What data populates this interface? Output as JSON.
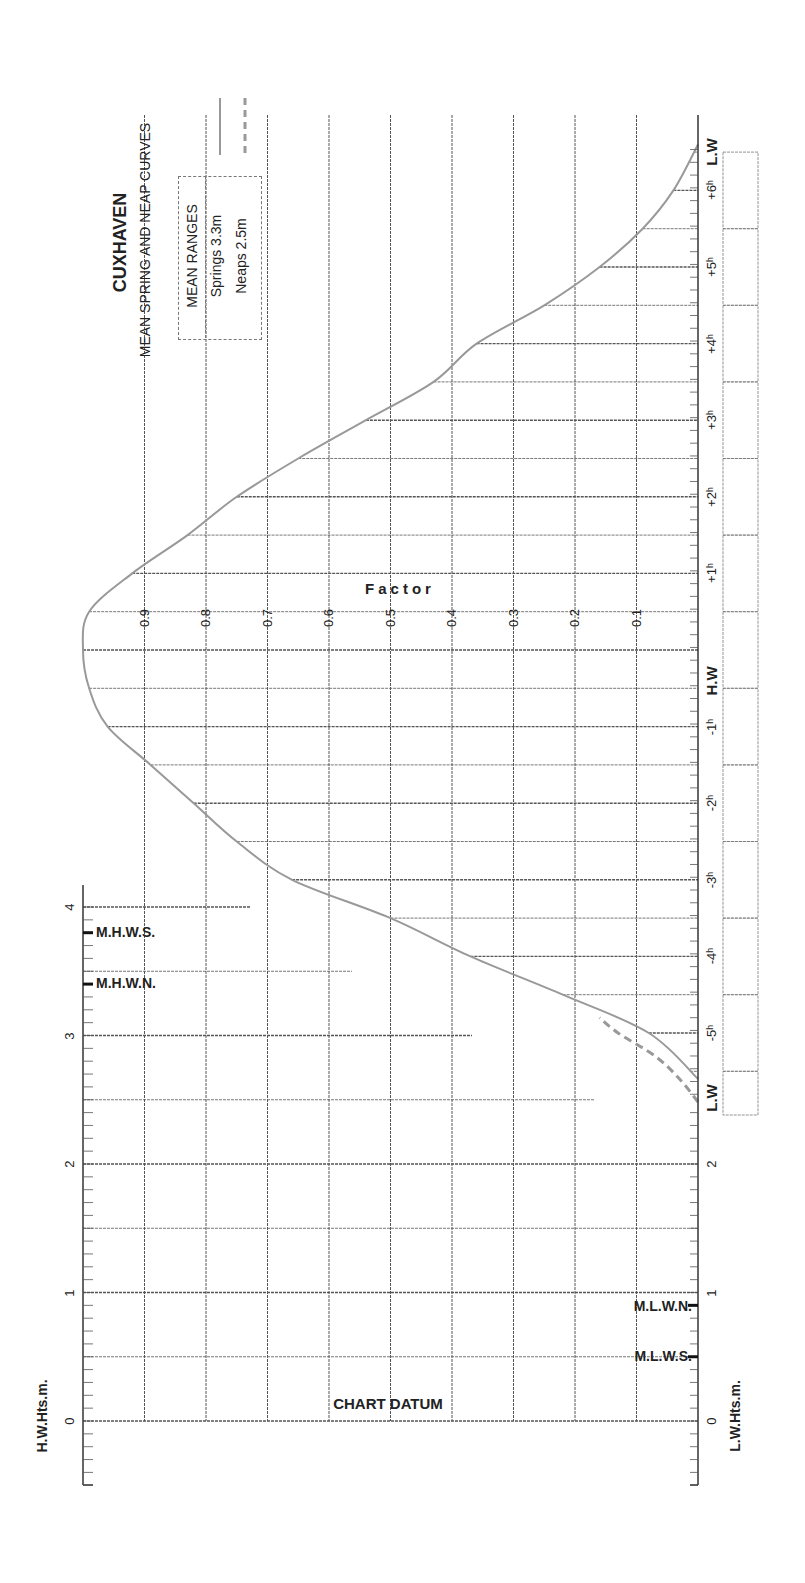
{
  "title": "CUXHAVEN",
  "subtitle": "MEAN SPRING AND NEAP CURVES",
  "legend": {
    "header": "MEAN RANGES",
    "springs": "Springs 3.3m",
    "neaps": "Neaps 2.5m"
  },
  "factor_label": "Factor",
  "chart_datum_label": "CHART DATUM",
  "hw_axis_label": "H.W.Hts.m.",
  "lw_axis_label": "L.W.Hts.m.",
  "level_labels": {
    "mhws": "M.H.W.S.",
    "mhwn": "M.H.W.N.",
    "mlwn": "M.L.W.N.",
    "mlws": "M.L.W.S."
  },
  "colors": {
    "curve": "#999999",
    "grid": "#555555",
    "text": "#222222"
  },
  "chart_data": {
    "type": "line",
    "title": "CUXHAVEN",
    "subtitle": "MEAN SPRING AND NEAP CURVES",
    "orientation": "rotated 90deg (time axis vertical)",
    "xlabel": "Time relative to H.W (hours)",
    "ylabel": "Factor",
    "time_tick_labels": [
      "L.W",
      "-5h",
      "-4h",
      "-3h",
      "-2h",
      "-1h",
      "H.W",
      "+1h",
      "+2h",
      "+3h",
      "+4h",
      "+5h",
      "+6h",
      "L.W"
    ],
    "factor_tick_labels": [
      "0.1",
      "0.2",
      "0.3",
      "0.4",
      "0.5",
      "0.6",
      "0.7",
      "0.8",
      "0.9"
    ],
    "factor_range": [
      0,
      1
    ],
    "hw_height_ticks": [
      "0",
      "1",
      "2",
      "3",
      "4"
    ],
    "lw_height_ticks": [
      "0",
      "1",
      "2"
    ],
    "hw_height_range": [
      -0.5,
      4.0
    ],
    "levels": {
      "M.H.W.S.": 3.8,
      "M.H.W.N.": 3.4,
      "M.L.W.N.": 0.9,
      "M.L.W.S.": 0.5
    },
    "mean_ranges": {
      "Springs": 3.3,
      "Neaps": 2.5
    },
    "series": [
      {
        "name": "Springs",
        "style": "solid",
        "x": [
          -5.6,
          -5.0,
          -4.5,
          -4.0,
          -3.5,
          -3.0,
          -2.5,
          -2.0,
          -1.5,
          -1.0,
          -0.5,
          0.0,
          0.5,
          1.0,
          1.5,
          2.0,
          2.5,
          3.0,
          3.5,
          4.0,
          4.5,
          5.0,
          5.5,
          6.0,
          6.6
        ],
        "values": [
          0.0,
          0.08,
          0.22,
          0.37,
          0.5,
          0.66,
          0.75,
          0.82,
          0.89,
          0.96,
          0.99,
          1.0,
          0.99,
          0.92,
          0.83,
          0.75,
          0.65,
          0.54,
          0.43,
          0.36,
          0.25,
          0.16,
          0.09,
          0.04,
          0.0
        ]
      },
      {
        "name": "Neaps",
        "style": "dashed",
        "x": [
          -5.9,
          -5.6,
          -5.3,
          -5.0,
          -4.8
        ],
        "values": [
          0.0,
          0.03,
          0.07,
          0.13,
          0.16
        ]
      }
    ],
    "grid": true,
    "legend_position": "top-left"
  }
}
